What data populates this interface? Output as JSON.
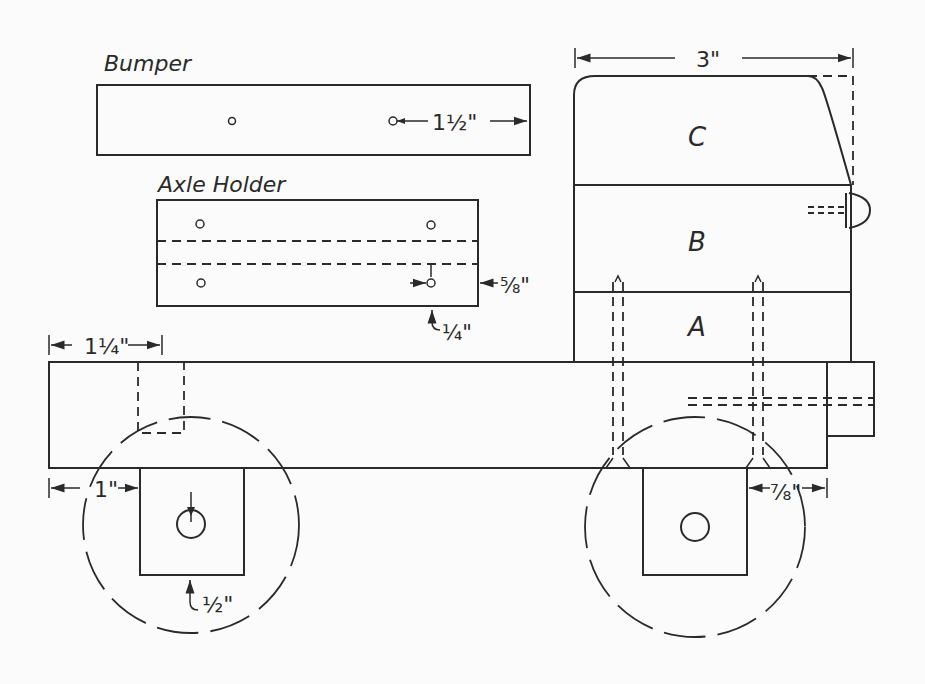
{
  "parts": {
    "bumper": {
      "label": "Bumper",
      "hole_offset": "1½\""
    },
    "axle_holder": {
      "label": "Axle Holder",
      "edge_dim": "⅝\"",
      "hole_dim": "¼\""
    },
    "cab": {
      "width_dim": "3\"",
      "block_c": "C",
      "block_b": "B",
      "block_a": "A"
    },
    "chassis": {
      "axle_holder_offset": "1¼\"",
      "front_offset": "1\"",
      "axle_bottom": "½\"",
      "rear_offset": "⅞\""
    }
  },
  "colors": {
    "line": "#2a2a2a",
    "paper": "#fbfbfb"
  }
}
